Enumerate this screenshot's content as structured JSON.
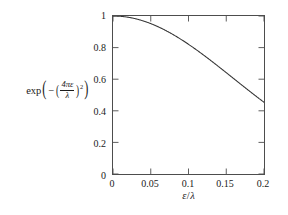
{
  "chart_data": {
    "type": "line",
    "title": "",
    "subtitle": "",
    "xlabel": "ε/λ",
    "ylabel": "exp(−(4πε/λ)²)",
    "xlim": [
      0,
      0.2
    ],
    "ylim": [
      0,
      1
    ],
    "grid": false,
    "legend": null,
    "frame": "box",
    "tick_direction": "in",
    "line_color": "#333333",
    "background_color": "#ffffff",
    "axis_color": "#4d4d4d",
    "xticks": [
      0,
      0.05,
      0.1,
      0.15,
      0.2
    ],
    "xtick_labels": [
      "0",
      "0.05",
      "0.1",
      "0.15",
      "0.2"
    ],
    "yticks": [
      0,
      0.2,
      0.4,
      0.6,
      0.8,
      1
    ],
    "ytick_labels": [
      "0",
      "0.2",
      "0.4",
      "0.6",
      "0.8",
      "1"
    ],
    "series": [
      {
        "name": "exp(-(4*pi*eps/lambda)^2)",
        "formula": "exp(-(4*pi*x)^2/8)",
        "x": [
          0,
          0.005,
          0.01,
          0.015,
          0.02,
          0.025,
          0.03,
          0.035,
          0.04,
          0.045,
          0.05,
          0.055,
          0.06,
          0.065,
          0.07,
          0.075,
          0.08,
          0.085,
          0.09,
          0.095,
          0.1,
          0.105,
          0.11,
          0.115,
          0.12,
          0.125,
          0.13,
          0.135,
          0.14,
          0.145,
          0.15,
          0.155,
          0.16,
          0.165,
          0.17,
          0.175,
          0.18,
          0.185,
          0.19,
          0.195,
          0.2
        ],
        "y": [
          1.0,
          0.9995,
          0.998,
          0.9956,
          0.9922,
          0.9878,
          0.9825,
          0.9762,
          0.9691,
          0.961,
          0.9521,
          0.9424,
          0.9318,
          0.9205,
          0.9085,
          0.8958,
          0.8824,
          0.8684,
          0.8539,
          0.8388,
          0.8233,
          0.7587,
          0.6923,
          0.6252,
          0.5586,
          0.4937,
          0.4316,
          0.3732,
          0.3192,
          0.2702,
          0.2265,
          0.1881,
          0.1548,
          0.1263,
          0.1023,
          0.0821,
          0.0654,
          0.0518,
          0.0407,
          0.0318,
          0.0246
        ]
      }
    ],
    "ylabel_parts": {
      "exp": "exp",
      "minus": "−",
      "numerator": "4πε",
      "denominator": "λ",
      "exponent": "2"
    },
    "xlabel_parts": {
      "numerator": "ε",
      "slash": "/",
      "denominator": "λ"
    }
  }
}
